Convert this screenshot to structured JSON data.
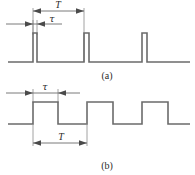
{
  "figure": {
    "title": "",
    "background_color": "#ffffff",
    "wave_color": "#6b6b6b",
    "dim_color": "#6b6b6b",
    "text_color": "#2b2b2b"
  },
  "panels": [
    {
      "id": "a",
      "caption": "(a)",
      "description": "narrow pulse train",
      "period_label": "T",
      "width_label": "τ",
      "baseline_y": 62,
      "high_y": 33,
      "pulses": [
        {
          "start_x": 33,
          "end_x": 37
        },
        {
          "start_x": 84,
          "end_x": 89
        },
        {
          "start_x": 142,
          "end_x": 147
        }
      ],
      "trace_start_x": 8,
      "trace_end_x": 190,
      "period_dim": {
        "x1": 33,
        "x2": 84,
        "y": 11,
        "label": "T"
      },
      "width_dim": {
        "x1": 33,
        "x2": 37,
        "y": 24,
        "label": "τ"
      }
    },
    {
      "id": "b",
      "caption": "(b)",
      "description": "rectangular square wave train",
      "period_label": "T",
      "width_label": "τ",
      "baseline_y": 124,
      "high_y": 102,
      "pulses": [
        {
          "start_x": 33,
          "end_x": 58
        },
        {
          "start_x": 87,
          "end_x": 113
        },
        {
          "start_x": 142,
          "end_x": 168
        }
      ],
      "trace_start_x": 8,
      "trace_end_x": 190,
      "period_dim": {
        "x1": 33,
        "x2": 87,
        "y": 139,
        "label": "T"
      },
      "width_dim": {
        "x1": 33,
        "x2": 58,
        "y": 93,
        "label": "τ"
      }
    }
  ],
  "labels": {
    "panel_a_caption": "(a)",
    "panel_b_caption": "(b)",
    "period_symbol": "T",
    "pulse_width_symbol": "τ"
  }
}
